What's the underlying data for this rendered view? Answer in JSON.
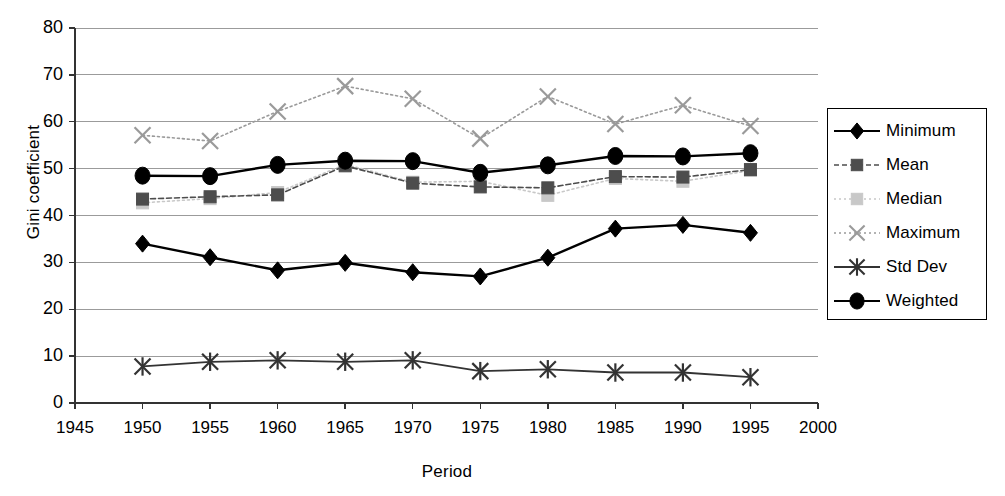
{
  "chart_data": {
    "type": "line",
    "title": "",
    "xlabel": "Period",
    "ylabel": "Gini coefficient",
    "xlim": [
      1945,
      2000
    ],
    "ylim": [
      0,
      80
    ],
    "ytick_step": 10,
    "xtick_step": 5,
    "grid": true,
    "legend_position": "right",
    "categories": [
      1950,
      1955,
      1960,
      1965,
      1970,
      1975,
      1980,
      1985,
      1990,
      1995
    ],
    "xticks": [
      "1945",
      "1950",
      "1955",
      "1960",
      "1965",
      "1970",
      "1975",
      "1980",
      "1985",
      "1990",
      "1995",
      "2000"
    ],
    "yticks": [
      "0",
      "10",
      "20",
      "30",
      "40",
      "50",
      "60",
      "70",
      "80"
    ],
    "series": [
      {
        "name": "Minimum",
        "marker": "diamond",
        "line": "solid",
        "color": "#000000",
        "values": [
          34.0,
          31.1,
          28.3,
          29.9,
          27.9,
          27.0,
          31.0,
          37.2,
          38.0,
          36.3
        ]
      },
      {
        "name": "Mean",
        "marker": "square",
        "line": "dashed",
        "color": "#4d4d4d",
        "values": [
          43.5,
          44.0,
          44.4,
          50.6,
          46.9,
          46.1,
          45.9,
          48.3,
          48.2,
          49.8
        ]
      },
      {
        "name": "Median",
        "marker": "square",
        "line": "dotted",
        "color": "#c8c8c8",
        "values": [
          42.7,
          43.6,
          44.9,
          50.9,
          47.1,
          47.3,
          44.3,
          47.9,
          47.3,
          49.6
        ]
      },
      {
        "name": "Maximum",
        "marker": "cross",
        "line": "dotted",
        "color": "#9a9a9a",
        "values": [
          57.1,
          55.9,
          62.2,
          67.6,
          64.9,
          56.4,
          65.4,
          59.5,
          63.5,
          59.1
        ]
      },
      {
        "name": "Std Dev",
        "marker": "star",
        "line": "solid",
        "color": "#333333",
        "values": [
          7.8,
          8.8,
          9.1,
          8.8,
          9.1,
          6.8,
          7.2,
          6.5,
          6.5,
          5.5
        ]
      },
      {
        "name": "Weighted",
        "marker": "circle",
        "line": "solid",
        "color": "#000000",
        "values": [
          48.5,
          48.4,
          50.8,
          51.7,
          51.6,
          49.1,
          50.7,
          52.7,
          52.6,
          53.3
        ]
      }
    ]
  }
}
